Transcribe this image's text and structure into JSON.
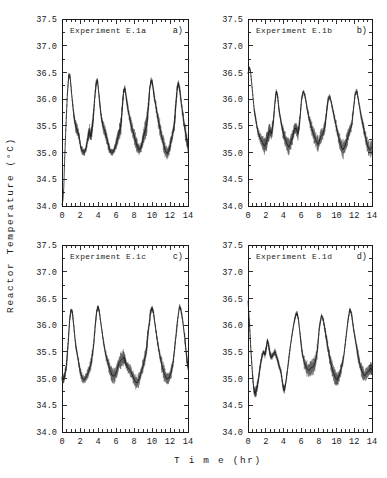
{
  "figure": {
    "xlabel": "T i m e  (hr)",
    "ylabel": "R e a c t o r   T e m p e r a t u r e   ( C)",
    "ylabel_plain": "Reactor Temperature (°C)",
    "x_unit": "hr",
    "y_unit": "°C"
  },
  "chart_data": [
    {
      "type": "line",
      "panel": "a)",
      "title": "Experiment E.1a",
      "xlabel": "Time (hr)",
      "ylabel": "Reactor Temperature (°C)",
      "xlim": [
        0,
        14
      ],
      "ylim": [
        34.0,
        37.5
      ],
      "xticks": [
        0,
        2,
        4,
        6,
        8,
        10,
        12,
        14
      ],
      "yticks": [
        34.0,
        34.5,
        35.0,
        35.5,
        36.0,
        36.5,
        37.0,
        37.5
      ],
      "grid": false,
      "legend": false,
      "x": [
        0.0,
        0.1,
        0.2,
        0.3,
        0.45,
        0.6,
        0.75,
        0.9,
        1.1,
        1.3,
        1.5,
        1.7,
        1.9,
        2.1,
        2.3,
        2.5,
        2.7,
        2.9,
        3.05,
        3.2,
        3.35,
        3.5,
        3.65,
        3.8,
        3.95,
        4.15,
        4.35,
        4.55,
        4.8,
        5.0,
        5.2,
        5.4,
        5.6,
        5.8,
        6.0,
        6.2,
        6.4,
        6.55,
        6.7,
        6.85,
        7.0,
        7.2,
        7.45,
        7.7,
        7.95,
        8.2,
        8.4,
        8.6,
        8.8,
        9.0,
        9.2,
        9.4,
        9.6,
        9.75,
        9.9,
        10.05,
        10.2,
        10.45,
        10.7,
        10.95,
        11.2,
        11.45,
        11.7,
        11.9,
        12.1,
        12.3,
        12.5,
        12.65,
        12.8,
        12.95,
        13.1,
        13.35,
        13.6,
        13.85,
        14.0
      ],
      "y": [
        34.02,
        34.1,
        34.35,
        34.9,
        35.55,
        36.1,
        36.45,
        36.42,
        36.05,
        35.72,
        35.5,
        35.42,
        35.3,
        35.08,
        35.02,
        35.0,
        35.1,
        35.3,
        35.4,
        35.3,
        35.45,
        35.7,
        36.05,
        36.3,
        36.35,
        36.0,
        35.68,
        35.5,
        35.38,
        35.25,
        35.1,
        35.02,
        35.0,
        35.05,
        35.15,
        35.28,
        35.4,
        35.5,
        35.85,
        36.15,
        36.2,
        35.95,
        35.7,
        35.5,
        35.35,
        35.2,
        35.1,
        35.05,
        35.1,
        35.25,
        35.4,
        35.5,
        35.85,
        36.2,
        36.35,
        36.3,
        36.1,
        35.85,
        35.6,
        35.4,
        35.22,
        35.05,
        34.98,
        35.05,
        35.2,
        35.35,
        35.55,
        35.9,
        36.2,
        36.3,
        36.15,
        35.8,
        35.5,
        35.25,
        35.1
      ],
      "noise_band": [
        0.0,
        0.0,
        0.0,
        0.02,
        0.03,
        0.04,
        0.05,
        0.05,
        0.04,
        0.06,
        0.09,
        0.1,
        0.08,
        0.06,
        0.05,
        0.05,
        0.07,
        0.1,
        0.11,
        0.1,
        0.1,
        0.08,
        0.06,
        0.05,
        0.05,
        0.06,
        0.09,
        0.11,
        0.1,
        0.09,
        0.07,
        0.05,
        0.05,
        0.06,
        0.08,
        0.11,
        0.13,
        0.13,
        0.09,
        0.06,
        0.05,
        0.07,
        0.1,
        0.12,
        0.12,
        0.11,
        0.09,
        0.07,
        0.08,
        0.11,
        0.14,
        0.15,
        0.1,
        0.06,
        0.05,
        0.05,
        0.07,
        0.1,
        0.13,
        0.14,
        0.13,
        0.11,
        0.09,
        0.09,
        0.08,
        0.11,
        0.12,
        0.09,
        0.06,
        0.05,
        0.07,
        0.1,
        0.12,
        0.11,
        0.1
      ]
    },
    {
      "type": "line",
      "panel": "b)",
      "title": "Experiment E.1b",
      "xlabel": "Time (hr)",
      "ylabel": "Reactor Temperature (°C)",
      "xlim": [
        0,
        14
      ],
      "ylim": [
        34.0,
        37.5
      ],
      "xticks": [
        0,
        2,
        4,
        6,
        8,
        10,
        12,
        14
      ],
      "yticks": [
        34.0,
        34.5,
        35.0,
        35.5,
        36.0,
        36.5,
        37.0,
        37.5
      ],
      "grid": false,
      "legend": false,
      "x": [
        0.0,
        0.15,
        0.3,
        0.5,
        0.7,
        0.9,
        1.1,
        1.35,
        1.6,
        1.85,
        2.05,
        2.25,
        2.45,
        2.65,
        2.85,
        3.05,
        3.2,
        3.35,
        3.5,
        3.7,
        3.9,
        4.1,
        4.35,
        4.6,
        4.85,
        5.05,
        5.25,
        5.45,
        5.65,
        5.85,
        6.05,
        6.25,
        6.45,
        6.7,
        6.95,
        7.2,
        7.45,
        7.7,
        7.95,
        8.2,
        8.45,
        8.7,
        8.9,
        9.05,
        9.25,
        9.45,
        9.7,
        9.95,
        10.2,
        10.45,
        10.7,
        10.95,
        11.2,
        11.45,
        11.7,
        11.9,
        12.1,
        12.3,
        12.5,
        12.75,
        13.0,
        13.25,
        13.5,
        13.75,
        14.0
      ],
      "y": [
        36.48,
        36.6,
        36.5,
        36.15,
        35.8,
        35.6,
        35.4,
        35.28,
        35.2,
        35.12,
        35.18,
        35.3,
        35.42,
        35.35,
        35.55,
        35.95,
        36.15,
        36.05,
        35.8,
        35.6,
        35.42,
        35.3,
        35.18,
        35.1,
        35.2,
        35.3,
        35.45,
        35.45,
        35.35,
        35.6,
        36.0,
        36.15,
        36.05,
        35.8,
        35.6,
        35.45,
        35.32,
        35.22,
        35.15,
        35.3,
        35.35,
        35.5,
        35.8,
        36.0,
        36.05,
        35.9,
        35.7,
        35.5,
        35.3,
        35.15,
        35.05,
        35.12,
        35.25,
        35.4,
        35.5,
        35.8,
        36.1,
        36.15,
        35.95,
        35.7,
        35.5,
        35.3,
        35.12,
        35.05,
        35.1
      ],
      "noise_band": [
        0.0,
        0.02,
        0.02,
        0.03,
        0.04,
        0.05,
        0.07,
        0.09,
        0.12,
        0.15,
        0.16,
        0.13,
        0.1,
        0.11,
        0.08,
        0.05,
        0.04,
        0.04,
        0.05,
        0.07,
        0.1,
        0.13,
        0.15,
        0.14,
        0.12,
        0.1,
        0.09,
        0.1,
        0.11,
        0.07,
        0.04,
        0.04,
        0.05,
        0.07,
        0.09,
        0.11,
        0.13,
        0.14,
        0.13,
        0.11,
        0.1,
        0.09,
        0.06,
        0.04,
        0.04,
        0.05,
        0.07,
        0.09,
        0.12,
        0.14,
        0.15,
        0.14,
        0.12,
        0.1,
        0.08,
        0.05,
        0.04,
        0.04,
        0.05,
        0.07,
        0.09,
        0.11,
        0.12,
        0.12,
        0.1
      ]
    },
    {
      "type": "line",
      "panel": "c)",
      "title": "Experiment E.1c",
      "xlabel": "Time (hr)",
      "ylabel": "Reactor Temperature (°C)",
      "xlim": [
        0,
        14
      ],
      "ylim": [
        34.0,
        37.5
      ],
      "xticks": [
        0,
        2,
        4,
        6,
        8,
        10,
        12,
        14
      ],
      "yticks": [
        34.0,
        34.5,
        35.0,
        35.5,
        36.0,
        36.5,
        37.0,
        37.5
      ],
      "grid": false,
      "legend": false,
      "x": [
        0.0,
        0.15,
        0.3,
        0.5,
        0.7,
        0.85,
        1.0,
        1.15,
        1.3,
        1.5,
        1.75,
        2.0,
        2.25,
        2.5,
        2.75,
        3.0,
        3.25,
        3.5,
        3.7,
        3.85,
        4.0,
        4.15,
        4.35,
        4.6,
        4.85,
        5.1,
        5.35,
        5.6,
        5.85,
        6.1,
        6.35,
        6.6,
        6.85,
        7.0,
        7.15,
        7.35,
        7.6,
        7.85,
        8.1,
        8.35,
        8.6,
        8.85,
        9.1,
        9.35,
        9.6,
        9.85,
        10.0,
        10.15,
        10.35,
        10.6,
        10.85,
        11.1,
        11.35,
        11.6,
        11.85,
        12.1,
        12.35,
        12.6,
        12.85,
        13.05,
        13.2,
        13.4,
        13.65,
        13.85,
        14.0
      ],
      "y": [
        35.0,
        34.98,
        35.05,
        35.25,
        35.7,
        36.1,
        36.28,
        36.25,
        36.0,
        35.65,
        35.4,
        35.15,
        35.0,
        34.98,
        35.05,
        35.15,
        35.3,
        35.6,
        36.0,
        36.25,
        36.35,
        36.25,
        36.0,
        35.7,
        35.45,
        35.3,
        35.15,
        35.05,
        35.05,
        35.15,
        35.3,
        35.35,
        35.4,
        35.35,
        35.25,
        35.2,
        35.15,
        35.05,
        34.95,
        34.92,
        35.0,
        35.15,
        35.3,
        35.5,
        35.9,
        36.25,
        36.32,
        36.25,
        36.0,
        35.7,
        35.45,
        35.25,
        35.1,
        35.0,
        35.0,
        35.1,
        35.3,
        35.7,
        36.1,
        36.35,
        36.3,
        36.1,
        35.75,
        35.4,
        35.2
      ],
      "noise_band": [
        0.06,
        0.07,
        0.08,
        0.08,
        0.06,
        0.04,
        0.04,
        0.04,
        0.05,
        0.07,
        0.08,
        0.08,
        0.07,
        0.07,
        0.08,
        0.09,
        0.1,
        0.07,
        0.05,
        0.04,
        0.04,
        0.04,
        0.05,
        0.07,
        0.09,
        0.11,
        0.12,
        0.12,
        0.11,
        0.12,
        0.13,
        0.13,
        0.1,
        0.09,
        0.08,
        0.09,
        0.1,
        0.11,
        0.12,
        0.11,
        0.09,
        0.1,
        0.12,
        0.13,
        0.09,
        0.05,
        0.04,
        0.04,
        0.06,
        0.08,
        0.1,
        0.12,
        0.13,
        0.12,
        0.11,
        0.1,
        0.09,
        0.06,
        0.04,
        0.04,
        0.04,
        0.05,
        0.08,
        0.1,
        0.1
      ]
    },
    {
      "type": "line",
      "panel": "d)",
      "title": "Experiment E.1d",
      "xlabel": "Time (hr)",
      "ylabel": "Reactor Temperature (°C)",
      "xlim": [
        0,
        14
      ],
      "ylim": [
        34.0,
        37.5
      ],
      "xticks": [
        0,
        2,
        4,
        6,
        8,
        10,
        12,
        14
      ],
      "yticks": [
        34.0,
        34.5,
        35.0,
        35.5,
        36.0,
        36.5,
        37.0,
        37.5
      ],
      "grid": false,
      "legend": false,
      "x": [
        0.0,
        0.15,
        0.3,
        0.5,
        0.65,
        0.8,
        0.95,
        1.15,
        1.35,
        1.55,
        1.75,
        1.9,
        2.05,
        2.2,
        2.35,
        2.5,
        2.65,
        2.85,
        3.05,
        3.25,
        3.5,
        3.75,
        3.95,
        4.1,
        4.25,
        4.45,
        4.7,
        4.95,
        5.2,
        5.4,
        5.55,
        5.7,
        5.9,
        6.1,
        6.35,
        6.6,
        6.85,
        7.1,
        7.35,
        7.6,
        7.85,
        8.05,
        8.3,
        8.5,
        8.7,
        8.9,
        9.15,
        9.4,
        9.65,
        9.9,
        10.1,
        10.3,
        10.55,
        10.8,
        11.05,
        11.3,
        11.5,
        11.7,
        11.9,
        12.15,
        12.4,
        12.65,
        12.9,
        13.15,
        13.4,
        13.65,
        13.85,
        14.0
      ],
      "y": [
        36.45,
        36.1,
        35.6,
        35.1,
        34.8,
        34.72,
        34.78,
        34.95,
        35.2,
        35.4,
        35.5,
        35.45,
        35.55,
        35.72,
        35.6,
        35.45,
        35.4,
        35.45,
        35.5,
        35.4,
        35.25,
        35.1,
        34.85,
        34.78,
        34.9,
        35.15,
        35.5,
        35.8,
        36.05,
        36.2,
        36.22,
        36.1,
        35.8,
        35.5,
        35.3,
        35.2,
        35.15,
        35.2,
        35.22,
        35.3,
        35.55,
        35.95,
        36.18,
        36.1,
        35.9,
        35.7,
        35.45,
        35.25,
        35.1,
        35.0,
        34.98,
        35.05,
        35.2,
        35.4,
        35.75,
        36.1,
        36.3,
        36.2,
        35.95,
        35.7,
        35.45,
        35.25,
        35.12,
        35.05,
        35.1,
        35.15,
        35.2,
        35.15
      ],
      "noise_band": [
        0.0,
        0.03,
        0.04,
        0.05,
        0.06,
        0.08,
        0.08,
        0.07,
        0.07,
        0.06,
        0.05,
        0.06,
        0.05,
        0.04,
        0.05,
        0.06,
        0.06,
        0.05,
        0.05,
        0.06,
        0.06,
        0.06,
        0.06,
        0.06,
        0.05,
        0.05,
        0.04,
        0.04,
        0.04,
        0.04,
        0.04,
        0.04,
        0.05,
        0.07,
        0.1,
        0.12,
        0.13,
        0.12,
        0.13,
        0.12,
        0.08,
        0.05,
        0.04,
        0.05,
        0.07,
        0.09,
        0.11,
        0.12,
        0.12,
        0.11,
        0.1,
        0.1,
        0.08,
        0.06,
        0.04,
        0.04,
        0.04,
        0.05,
        0.06,
        0.08,
        0.1,
        0.11,
        0.11,
        0.1,
        0.09,
        0.09,
        0.09,
        0.09
      ]
    }
  ],
  "panel_geometry": [
    {
      "x": 62,
      "y": 19,
      "w": 126,
      "h": 187
    },
    {
      "x": 248,
      "y": 19,
      "w": 124,
      "h": 187
    },
    {
      "x": 62,
      "y": 245,
      "w": 126,
      "h": 187
    },
    {
      "x": 248,
      "y": 245,
      "w": 124,
      "h": 187
    }
  ]
}
